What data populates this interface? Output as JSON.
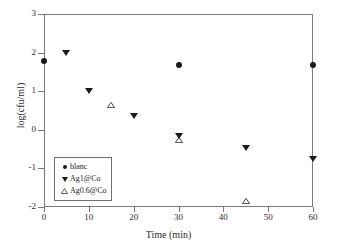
{
  "chart_data": {
    "type": "scatter",
    "title": "",
    "xlabel": "Time (min)",
    "ylabel": "log(cfu/ml)",
    "xlim": [
      0,
      60
    ],
    "ylim": [
      -2,
      3
    ],
    "xticks": [
      0,
      10,
      20,
      30,
      40,
      50,
      60
    ],
    "yticks": [
      3,
      2,
      1,
      0,
      -1,
      -2
    ],
    "xtick_labels": [
      "0",
      "10",
      "20",
      "30",
      "40",
      "50",
      "60"
    ],
    "ytick_labels": [
      "3",
      "2",
      "1",
      "0",
      "-1",
      "-2"
    ],
    "grid": false,
    "legend_position": "lower left",
    "series": [
      {
        "name": "blanc",
        "marker": "filled-circle",
        "color": "#1a1a1a",
        "points": [
          {
            "x": 0,
            "y": 1.78
          },
          {
            "x": 30,
            "y": 1.67
          },
          {
            "x": 60,
            "y": 1.68
          }
        ]
      },
      {
        "name": "Ag1@Co",
        "marker": "filled-triangle-down",
        "color": "#1a1a1a",
        "points": [
          {
            "x": 5,
            "y": 2.0
          },
          {
            "x": 10,
            "y": 1.0
          },
          {
            "x": 20,
            "y": 0.35
          },
          {
            "x": 30,
            "y": -0.15
          },
          {
            "x": 45,
            "y": -0.48
          },
          {
            "x": 60,
            "y": -0.75
          }
        ]
      },
      {
        "name": "Ag0.6@Co",
        "marker": "open-triangle-up",
        "color": "#1a1a1a",
        "points": [
          {
            "x": 15,
            "y": 0.65
          },
          {
            "x": 30,
            "y": -0.27
          },
          {
            "x": 45,
            "y": -1.85
          }
        ]
      }
    ]
  },
  "legend": {
    "entries": [
      {
        "label": "blanc",
        "marker": "filled-circle"
      },
      {
        "label": "Ag1@Co",
        "marker": "filled-triangle-down"
      },
      {
        "label": "Ag0.6@Co",
        "marker": "open-triangle-up"
      }
    ]
  },
  "style": {
    "axis_color": "#7a7a7a",
    "marker_color": "#1a1a1a",
    "background": "#ffffff"
  }
}
